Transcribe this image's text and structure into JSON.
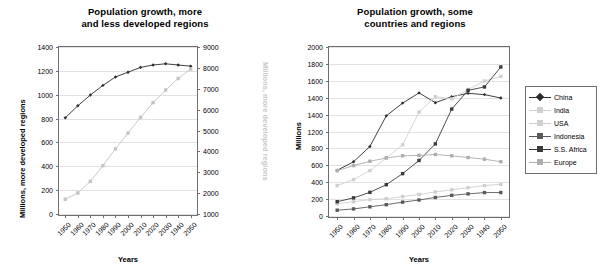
{
  "left_chart": {
    "title_line1": "Population growth, more",
    "title_line2": "and less developed regions",
    "ylabel_left": "Millions, more developed regions",
    "ylabel_right": "Millions, more developed regions",
    "xlabel": "Years"
  },
  "right_chart": {
    "title_line1": "Population growth, some",
    "title_line2": "countries and regions",
    "ylabel": "Millions",
    "xlabel": "Years"
  },
  "colors": {
    "dark": "#2b2b2b",
    "mid_dark": "#4a4a4a",
    "grey": "#9a9a9a",
    "light_grey": "#c4c4c4",
    "pale_grey": "#d6d6d6",
    "axis": "#6e6e6e",
    "grid": "#e2e2e2",
    "ghost_label": "#c9c9c9"
  },
  "chart_data": [
    {
      "type": "line",
      "title": "Population growth, more and less developed regions",
      "xlabel": "Years",
      "ylabel": "Millions, more developed regions",
      "ylabel_secondary": "Millions, more developed regions",
      "grid": true,
      "legend": "none",
      "x": [
        1950,
        1960,
        1970,
        1980,
        1990,
        2000,
        2010,
        2020,
        2030,
        1940,
        2050
      ],
      "xtick_labels": [
        "1950",
        "1960",
        "1970",
        "1980",
        "1990",
        "2000",
        "2010",
        "2020",
        "2030",
        "1940",
        "2050"
      ],
      "ylim": [
        0,
        1400
      ],
      "ytick_labels": [
        "1400",
        "1200",
        "1000",
        "800",
        "600",
        "400",
        "200",
        "0"
      ],
      "ylim_secondary": [
        1000,
        9000
      ],
      "ytick_labels_secondary": [
        "9000",
        "8000",
        "7000",
        "6000",
        "5000",
        "4000",
        "3000",
        "2000",
        "1000"
      ],
      "series": [
        {
          "name": "More developed regions",
          "axis": "left",
          "color": "#2b2b2b",
          "marker": "diamond",
          "values": [
            810,
            910,
            1000,
            1080,
            1150,
            1190,
            1230,
            1250,
            1260,
            1250,
            1240
          ]
        },
        {
          "name": "Less developed regions",
          "axis": "right",
          "color": "#c4c4c4",
          "marker": "square",
          "values": [
            1750,
            2050,
            2600,
            3350,
            4150,
            4900,
            5650,
            6350,
            6950,
            7500,
            7950
          ]
        }
      ]
    },
    {
      "type": "line",
      "title": "Population growth, some countries and regions",
      "xlabel": "Years",
      "ylabel": "Millions",
      "grid": true,
      "legend": "right",
      "x": [
        1950,
        1960,
        1970,
        1980,
        1990,
        2000,
        2010,
        2020,
        2030,
        1940,
        2050
      ],
      "xtick_labels": [
        "1950",
        "1960",
        "1970",
        "1980",
        "1990",
        "2000",
        "2010",
        "2020",
        "2030",
        "1940",
        "2050"
      ],
      "ylim": [
        0,
        2000
      ],
      "ytick_labels": [
        "2000",
        "1800",
        "1600",
        "1400",
        "1400",
        "1200",
        "800",
        "600",
        "400",
        "200",
        "0"
      ],
      "series": [
        {
          "name": "China",
          "color": "#2b2b2b",
          "marker": "diamond",
          "values": [
            550,
            650,
            830,
            1190,
            1340,
            1460,
            1345,
            1415,
            1455,
            1440,
            1400
          ]
        },
        {
          "name": "India",
          "color": "#d0d0d0",
          "marker": "square",
          "values": [
            370,
            440,
            545,
            695,
            850,
            1235,
            1415,
            1390,
            1500,
            1600,
            1655
          ]
        },
        {
          "name": "USA",
          "color": "#cfcfcf",
          "marker": "square",
          "values": [
            155,
            180,
            205,
            215,
            240,
            265,
            295,
            320,
            345,
            370,
            385
          ]
        },
        {
          "name": "Indonesia",
          "color": "#5a5a5a",
          "marker": "square",
          "values": [
            80,
            95,
            120,
            145,
            175,
            200,
            230,
            255,
            272,
            287,
            288
          ]
        },
        {
          "name": "S.S. Africa",
          "color": "#3a3a3a",
          "marker": "square",
          "values": [
            180,
            225,
            290,
            380,
            510,
            665,
            860,
            1270,
            1490,
            1530,
            1765
          ]
        },
        {
          "name": "Europe",
          "color": "#adadad",
          "marker": "square",
          "values": [
            545,
            605,
            655,
            695,
            720,
            725,
            735,
            720,
            700,
            680,
            650
          ]
        }
      ]
    }
  ],
  "legend": {
    "items": [
      {
        "label": "China",
        "color": "#2b2b2b",
        "marker": "diamond"
      },
      {
        "label": "India",
        "color": "#d0d0d0",
        "marker": "square"
      },
      {
        "label": "USA",
        "color": "#cfcfcf",
        "marker": "square"
      },
      {
        "label": "Indonesia",
        "color": "#5a5a5a",
        "marker": "square"
      },
      {
        "label": "S.S. Africa",
        "color": "#3a3a3a",
        "marker": "square"
      },
      {
        "label": "Europe",
        "color": "#adadad",
        "marker": "square"
      }
    ]
  }
}
